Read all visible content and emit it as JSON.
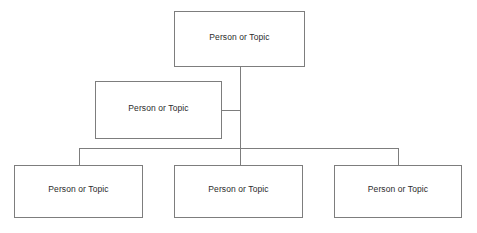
{
  "diagram": {
    "type": "organizational-chart",
    "background_color": "#ffffff",
    "line_color": "#7d7d7d",
    "text_color": "#2b2b2b",
    "nodes": [
      {
        "id": "root",
        "label": "Person or Topic",
        "level": 0
      },
      {
        "id": "assistant",
        "label": "Person or Topic",
        "level": 1
      },
      {
        "id": "child1",
        "label": "Person or Topic",
        "level": 2
      },
      {
        "id": "child2",
        "label": "Person or Topic",
        "level": 2
      },
      {
        "id": "child3",
        "label": "Person or Topic",
        "level": 2
      }
    ],
    "connections": [
      {
        "from": "root",
        "to": "bus",
        "style": "vertical"
      },
      {
        "from": "assistant",
        "to": "trunk",
        "style": "horizontal-stub"
      },
      {
        "from": "bus",
        "to": "child1",
        "style": "elbow-left"
      },
      {
        "from": "bus",
        "to": "child2",
        "style": "vertical"
      },
      {
        "from": "bus",
        "to": "child3",
        "style": "elbow-right"
      }
    ]
  }
}
